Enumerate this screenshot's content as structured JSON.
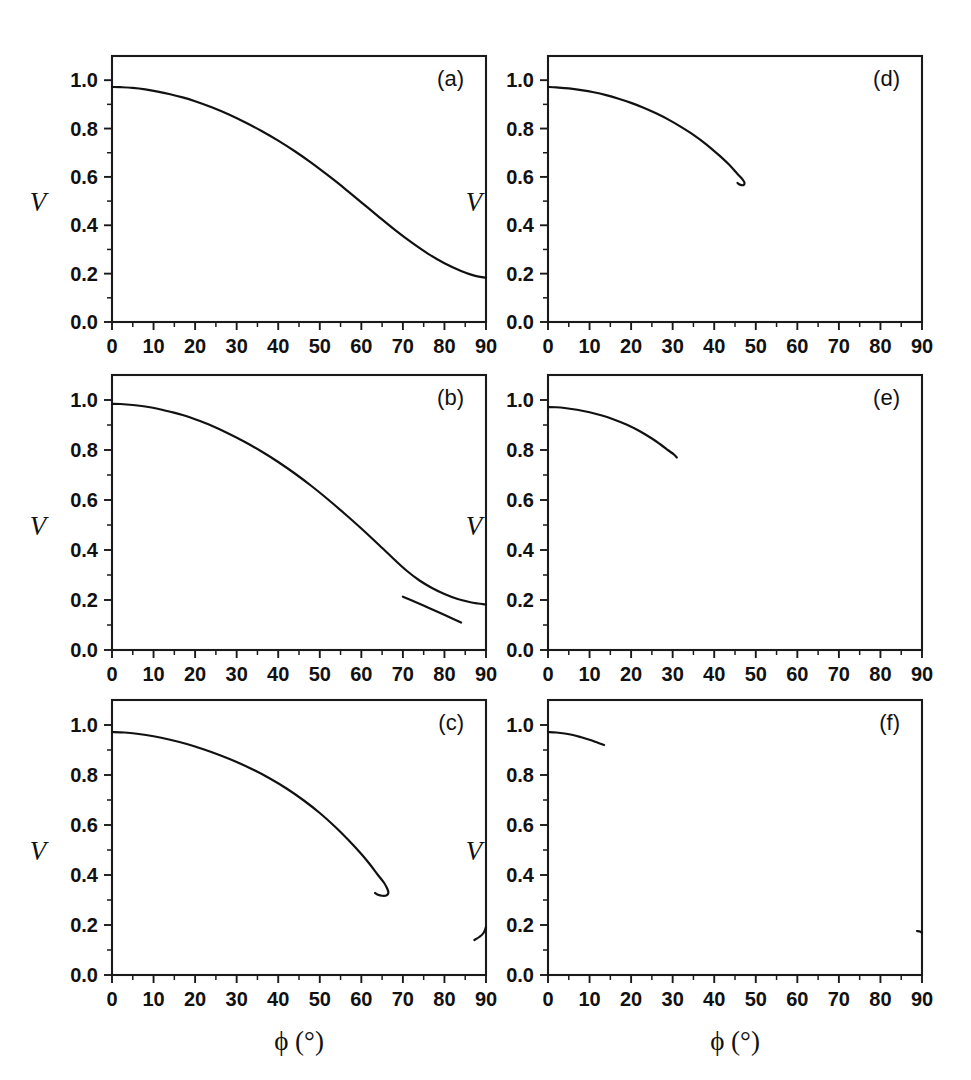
{
  "figure": {
    "background": "#ffffff",
    "line_color": "#111111",
    "axis_color": "#1a1a1a",
    "x_axis_title": "ϕ (°)",
    "y_axis_title": "V",
    "columns": 2,
    "rows": 3
  },
  "axes": {
    "x_ticks": [
      "0",
      "10",
      "20",
      "30",
      "40",
      "50",
      "60",
      "70",
      "80",
      "90"
    ],
    "x_tick_values": [
      0,
      10,
      20,
      30,
      40,
      50,
      60,
      70,
      80,
      90
    ],
    "x_minor_values": [
      5,
      15,
      25,
      35,
      45,
      55,
      65,
      75,
      85
    ],
    "y_ticks": [
      "0.0",
      "0.2",
      "0.4",
      "0.6",
      "0.8",
      "1.0"
    ],
    "y_tick_values": [
      0.0,
      0.2,
      0.4,
      0.6,
      0.8,
      1.0
    ],
    "y_minor_values": [
      0.1,
      0.3,
      0.5,
      0.7,
      0.9
    ],
    "xlim": [
      0,
      90
    ],
    "ylim": [
      0.0,
      1.1
    ]
  },
  "chart_data": {
    "type": "line",
    "title": "",
    "xlabel": "ϕ (°)",
    "ylabel": "V",
    "xlim": [
      0,
      90
    ],
    "ylim": [
      0.0,
      1.1
    ],
    "grid": false,
    "legend": "none",
    "panels": [
      {
        "id": "a",
        "label": "(a)",
        "row": 0,
        "column": 0,
        "series": [
          {
            "name": "main-branch",
            "x": [
              0,
              2,
              5,
              8,
              11,
              14,
              17,
              20,
              24,
              28,
              32,
              36,
              40,
              44,
              48,
              52,
              56,
              60,
              64,
              68,
              72,
              76,
              80,
              84,
              87,
              90
            ],
            "y": [
              0.972,
              0.971,
              0.968,
              0.962,
              0.953,
              0.942,
              0.929,
              0.913,
              0.888,
              0.859,
              0.826,
              0.79,
              0.75,
              0.706,
              0.658,
              0.606,
              0.552,
              0.495,
              0.438,
              0.382,
              0.33,
              0.283,
              0.243,
              0.211,
              0.193,
              0.183
            ]
          }
        ]
      },
      {
        "id": "b",
        "label": "(b)",
        "row": 1,
        "column": 0,
        "series": [
          {
            "name": "main-branch",
            "x": [
              0,
              2,
              5,
              8,
              11,
              14,
              17,
              20,
              24,
              28,
              32,
              36,
              40,
              44,
              48,
              52,
              56,
              60,
              64,
              68,
              71,
              74,
              77,
              80,
              83,
              86,
              88,
              90
            ],
            "y": [
              0.985,
              0.984,
              0.98,
              0.974,
              0.965,
              0.953,
              0.94,
              0.923,
              0.897,
              0.866,
              0.832,
              0.794,
              0.752,
              0.706,
              0.656,
              0.602,
              0.545,
              0.486,
              0.424,
              0.361,
              0.316,
              0.278,
              0.248,
              0.224,
              0.205,
              0.192,
              0.186,
              0.182
            ]
          },
          {
            "name": "lower-branch",
            "x": [
              70,
              73,
              76,
              79,
              82,
              84
            ],
            "y": [
              0.213,
              0.192,
              0.17,
              0.148,
              0.125,
              0.11
            ]
          }
        ]
      },
      {
        "id": "c",
        "label": "(c)",
        "row": 2,
        "column": 0,
        "series": [
          {
            "name": "main-branch",
            "x": [
              0,
              3,
              6,
              10,
              14,
              18,
              22,
              26,
              30,
              34,
              38,
              42,
              46,
              50,
              54,
              57,
              60,
              62,
              64,
              65.5,
              66.3,
              66.5,
              66.0,
              65.0,
              64.0,
              63.3
            ],
            "y": [
              0.972,
              0.97,
              0.965,
              0.955,
              0.941,
              0.924,
              0.903,
              0.879,
              0.852,
              0.821,
              0.786,
              0.746,
              0.7,
              0.648,
              0.588,
              0.538,
              0.484,
              0.444,
              0.4,
              0.368,
              0.343,
              0.328,
              0.318,
              0.317,
              0.321,
              0.328
            ]
          },
          {
            "name": "edge-branch",
            "x": [
              87.2,
              88.4,
              89.4,
              90
            ],
            "y": [
              0.14,
              0.152,
              0.168,
              0.192
            ]
          }
        ]
      },
      {
        "id": "d",
        "label": "(d)",
        "row": 0,
        "column": 1,
        "series": [
          {
            "name": "main-branch",
            "x": [
              0,
              2,
              5,
              8,
              11,
              14,
              17,
              20,
              23,
              26,
              29,
              32,
              35,
              38,
              41,
              43.5,
              45.5,
              46.8,
              47.3,
              47.0,
              46.2,
              45.6
            ],
            "y": [
              0.972,
              0.97,
              0.966,
              0.959,
              0.95,
              0.938,
              0.923,
              0.906,
              0.886,
              0.863,
              0.837,
              0.807,
              0.774,
              0.736,
              0.692,
              0.652,
              0.614,
              0.59,
              0.575,
              0.566,
              0.568,
              0.575
            ]
          }
        ]
      },
      {
        "id": "e",
        "label": "(e)",
        "row": 1,
        "column": 1,
        "series": [
          {
            "name": "main-branch",
            "x": [
              0,
              2,
              4,
              7,
              10,
              13,
              16,
              19,
              22,
              25,
              27,
              29,
              30.3,
              31.0
            ],
            "y": [
              0.972,
              0.971,
              0.968,
              0.961,
              0.951,
              0.938,
              0.921,
              0.901,
              0.876,
              0.846,
              0.823,
              0.798,
              0.782,
              0.77
            ]
          }
        ]
      },
      {
        "id": "f",
        "label": "(f)",
        "row": 2,
        "column": 1,
        "series": [
          {
            "name": "main-branch",
            "x": [
              0,
              2,
              4,
              6,
              8,
              10,
              12,
              13.5
            ],
            "y": [
              0.972,
              0.97,
              0.966,
              0.96,
              0.951,
              0.941,
              0.929,
              0.92
            ]
          },
          {
            "name": "edge-branch",
            "x": [
              88.8,
              89.5,
              90
            ],
            "y": [
              0.176,
              0.174,
              0.168
            ]
          }
        ]
      }
    ]
  }
}
